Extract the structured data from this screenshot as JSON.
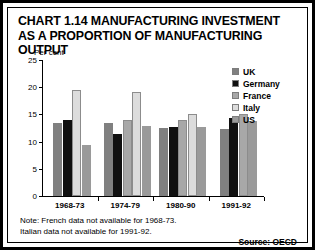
{
  "title": "CHART 1.14 MANUFACTURING INVESTMENT AS A PROPORTION OF MANUFACTURING OUTPUT",
  "axis_unit_label": "Per cent",
  "notes": {
    "line1": "Note: French data not available for 1968-73.",
    "line2": "Italian data not available for 1991-92."
  },
  "source": "Source: OECD",
  "colors": {
    "uk": "#808080",
    "germany": "#101010",
    "france": "#a8a8a8",
    "italy": "#dcdcdc",
    "us": "#9a9a9a",
    "axis": "#000000",
    "background": "#ffffff",
    "frame": "#000000"
  },
  "legend": {
    "items": [
      {
        "label": "UK",
        "color_key": "uk"
      },
      {
        "label": "Germany",
        "color_key": "germany"
      },
      {
        "label": "France",
        "color_key": "france"
      },
      {
        "label": "Italy",
        "color_key": "italy"
      },
      {
        "label": "US",
        "color_key": "us"
      }
    ]
  },
  "chart_data": {
    "type": "bar",
    "title": "CHART 1.14 MANUFACTURING INVESTMENT AS A PROPORTION OF MANUFACTURING OUTPUT",
    "xlabel": "",
    "ylabel": "Per cent",
    "ylim": [
      0,
      25
    ],
    "yticks": [
      0,
      5,
      10,
      15,
      20,
      25
    ],
    "grid": false,
    "legend_position": "right",
    "categories": [
      "1968-73",
      "1974-79",
      "1980-90",
      "1991-92"
    ],
    "series": [
      {
        "name": "UK",
        "values": [
          13.5,
          13.5,
          12.5,
          12.4
        ]
      },
      {
        "name": "Germany",
        "values": [
          14.0,
          11.4,
          12.6,
          14.4
        ]
      },
      {
        "name": "France",
        "values": [
          null,
          14.0,
          14.0,
          15.1
        ]
      },
      {
        "name": "Italy",
        "values": [
          19.5,
          19.1,
          15.0,
          null
        ]
      },
      {
        "name": "US",
        "values": [
          9.4,
          12.8,
          12.6,
          13.7
        ]
      }
    ],
    "annotations": [
      "Note: French data not available for 1968-73.",
      "Italian data not available for 1991-92."
    ]
  }
}
